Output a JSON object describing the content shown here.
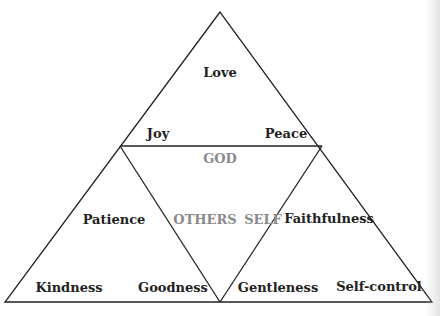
{
  "diagram": {
    "colors": {
      "line": "#222222",
      "text": "#222222",
      "center_text": "#8a8a8a",
      "background": "#ffffff"
    },
    "top_triangle": {
      "top": "Love",
      "left": "Joy",
      "right": "Peace"
    },
    "center_triangle": {
      "top": "GOD",
      "left": "OTHERS",
      "right": "SELF"
    },
    "left_triangle": {
      "top": "Patience",
      "left": "Kindness",
      "right": "Goodness"
    },
    "right_triangle": {
      "top": "Faithfulness",
      "left": "Gentleness",
      "right": "Self-control"
    }
  }
}
